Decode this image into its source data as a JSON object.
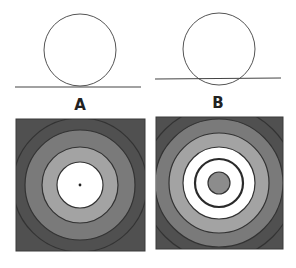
{
  "panels": [
    {
      "label": "A",
      "description": "circle tangent to line",
      "circle": {
        "cx": 80,
        "cy": 50,
        "r": 36
      },
      "line": {
        "x1": 15,
        "y1": 87,
        "x2": 141,
        "y2": 87
      },
      "label_pos": {
        "x": 80,
        "y": 110
      },
      "pattern": {
        "square": {
          "x": 16,
          "y": 119,
          "w": 129,
          "h": 132,
          "fill": "#505050"
        },
        "center": {
          "x": 80,
          "y": 185
        },
        "rings": [
          {
            "r": 55,
            "fill": "#7a7a7a"
          },
          {
            "r": 38,
            "fill": "#a3a3a3"
          },
          {
            "r": 23,
            "fill": "#ffffff"
          }
        ],
        "center_dot": {
          "r": 1.4,
          "fill": "#222222"
        }
      }
    },
    {
      "label": "B",
      "description": "circle intersecting line",
      "circle": {
        "cx": 219,
        "cy": 49,
        "r": 36
      },
      "line": {
        "x1": 155,
        "y1": 79,
        "x2": 281,
        "y2": 78
      },
      "label_pos": {
        "x": 218,
        "y": 108
      },
      "pattern": {
        "square": {
          "x": 156,
          "y": 117,
          "w": 127,
          "h": 132,
          "fill": "#505050"
        },
        "center": {
          "x": 219,
          "y": 183
        },
        "rings": [
          {
            "r": 64,
            "fill": "#7a7a7a"
          },
          {
            "r": 50,
            "fill": "#a3a3a3"
          },
          {
            "r": 36,
            "fill": "#ffffff"
          },
          {
            "r": 24,
            "fill": "#ffffff",
            "stroke_width": 2.2
          },
          {
            "r": 11,
            "fill": "#8c8c8c"
          }
        ]
      }
    }
  ],
  "colors": {
    "stroke": "#333333",
    "background": "#ffffff"
  }
}
